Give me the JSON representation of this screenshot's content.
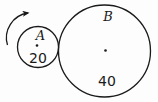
{
  "diagram": {
    "background_color": "#fdfdfd",
    "line_color": "#1a1a1a",
    "circles": [
      {
        "label": "A",
        "radius_value": "20",
        "has_center_dot": true
      },
      {
        "label": "B",
        "radius_value": "40",
        "has_center_dot": true
      }
    ],
    "arrow": {
      "direction": "clockwise",
      "attached_to": "A"
    }
  }
}
